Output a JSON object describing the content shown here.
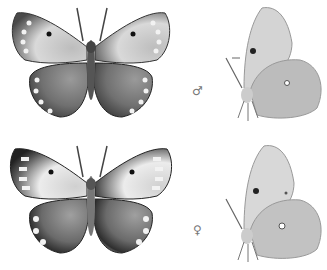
{
  "plate": {
    "rows": [
      {
        "sex": "male",
        "symbol": "♂"
      },
      {
        "sex": "female",
        "symbol": "♀"
      }
    ],
    "views": [
      "dorsal",
      "ventral"
    ]
  },
  "colors": {
    "background": "#ffffff",
    "wing_dark": "#3a3a3a",
    "wing_mid": "#8a8a8a",
    "wing_light": "#e8e8e8",
    "ventral_wing": "#c9c9c9"
  }
}
